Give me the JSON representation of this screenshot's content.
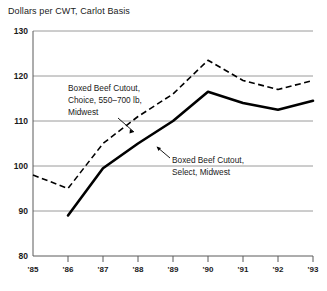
{
  "chart_data": {
    "type": "line",
    "title": "Dollars per CWT, Carlot Basis",
    "xlabel": "",
    "ylabel": "",
    "ylim": [
      80,
      130
    ],
    "yticks": [
      80,
      90,
      100,
      110,
      120,
      130
    ],
    "ytick_labels": [
      "80",
      "90",
      "100",
      "110",
      "120",
      "130"
    ],
    "grid": true,
    "legend": "annotations-inline",
    "x": [
      "'85",
      "'86",
      "'87",
      "'88",
      "'89",
      "'90",
      "'91",
      "'92",
      "'93"
    ],
    "series": [
      {
        "name": "Boxed Beef Cutout, Choice, 550-700 lb, Midwest",
        "style": "dashed",
        "color": "#000000",
        "values": [
          98,
          95,
          105,
          111,
          116,
          123.5,
          119,
          117,
          119
        ]
      },
      {
        "name": "Boxed Beef Cutout, Select, Midwest",
        "style": "solid",
        "color": "#000000",
        "values": [
          null,
          89,
          99.5,
          105,
          110,
          116.5,
          114,
          112.5,
          114.5
        ]
      }
    ],
    "annotations": [
      {
        "id": "choice",
        "lines": [
          "Boxed Beef Cutout,",
          "Choice, 550–700 lb,",
          "Midwest"
        ]
      },
      {
        "id": "select",
        "lines": [
          "Boxed Beef Cutout,",
          "Select, Midwest"
        ]
      }
    ]
  },
  "axis": {
    "y": {
      "t130": "130",
      "t120": "120",
      "t110": "110",
      "t100": "100",
      "t90": "90",
      "t80": "80"
    },
    "x": {
      "t85": "'85",
      "t86": "'86",
      "t87": "'87",
      "t88": "'88",
      "t89": "'89",
      "t90": "'90",
      "t91": "'91",
      "t92": "'92",
      "t93": "'93"
    }
  },
  "annotations": {
    "choice": {
      "line1": "Boxed Beef Cutout,",
      "line2": "Choice, 550–700 lb,",
      "line3": "Midwest"
    },
    "select": {
      "line1": "Boxed Beef Cutout,",
      "line2": "Select, Midwest"
    }
  },
  "header": {
    "title": "Dollars per CWT, Carlot Basis"
  }
}
